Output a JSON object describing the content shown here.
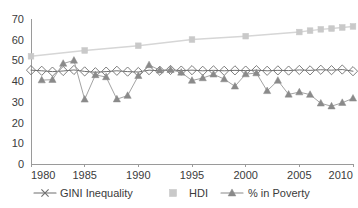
{
  "chart_data": {
    "type": "line",
    "title": "",
    "subtitle": "",
    "xlabel": "",
    "ylabel": "",
    "xlim": [
      1980,
      2010
    ],
    "ylim": [
      0,
      70
    ],
    "ytick_step": 10,
    "xtick_step": 5,
    "yticks": [
      "0",
      "10",
      "20",
      "30",
      "40",
      "50",
      "60",
      "70"
    ],
    "xticks": [
      "1980",
      "1985",
      "1990",
      "1995",
      "2000",
      "2005",
      "2010"
    ],
    "grid": false,
    "legend_position": "bottom",
    "series": [
      {
        "name": "GINI Inequality",
        "marker": "x-diamond",
        "color": "#6e6e6e",
        "line_color": "#6e6e6e",
        "x": [
          1980,
          1981,
          1982,
          1983,
          1984,
          1985,
          1986,
          1987,
          1988,
          1989,
          1990,
          1991,
          1992,
          1993,
          1994,
          1995,
          1996,
          1997,
          1998,
          1999,
          2000,
          2001,
          2002,
          2003,
          2004,
          2005,
          2006,
          2007,
          2008,
          2009,
          2010
        ],
        "values": [
          45.3,
          45.0,
          44.6,
          44.9,
          45.4,
          44.7,
          44.3,
          44.6,
          45.0,
          44.6,
          44.4,
          45.3,
          45.0,
          45.4,
          45.1,
          45.3,
          45.0,
          45.2,
          45.0,
          45.2,
          45.1,
          45.3,
          45.0,
          45.2,
          45.1,
          45.4,
          45.2,
          45.5,
          45.3,
          45.6,
          44.8
        ]
      },
      {
        "name": "HDI",
        "marker": "square",
        "color": "#c9c9c9",
        "line_color": "#d6d6d6",
        "x": [
          1980,
          1985,
          1990,
          1995,
          2000,
          2005,
          2006,
          2007,
          2008,
          2009,
          2010
        ],
        "values": [
          52.0,
          54.8,
          57.1,
          60.1,
          61.7,
          63.7,
          64.4,
          65.0,
          65.4,
          65.9,
          66.4
        ]
      },
      {
        "name": "% in Poverty",
        "marker": "triangle",
        "color": "#8a8a8a",
        "line_color": "#a3a3a3",
        "x": [
          1981,
          1982,
          1983,
          1984,
          1985,
          1986,
          1987,
          1988,
          1989,
          1990,
          1991,
          1992,
          1993,
          1994,
          1995,
          1996,
          1997,
          1998,
          1999,
          2000,
          2001,
          2002,
          2003,
          2004,
          2005,
          2006,
          2007,
          2008,
          2009,
          2010
        ],
        "values": [
          40.5,
          40.7,
          48.5,
          50.0,
          31.2,
          43.0,
          42.0,
          31.3,
          33.0,
          42.6,
          47.8,
          45.3,
          45.5,
          44.2,
          40.3,
          41.5,
          43.3,
          41.0,
          37.5,
          43.4,
          43.9,
          35.3,
          40.3,
          33.6,
          34.7,
          33.5,
          29.3,
          27.9,
          29.6,
          31.7
        ]
      }
    ]
  },
  "legend": {
    "items": [
      {
        "label": "GINI Inequality",
        "marker": "x-diamond",
        "color": "#6e6e6e"
      },
      {
        "label": "HDI",
        "marker": "square",
        "color": "#c9c9c9"
      },
      {
        "label": "% in Poverty",
        "marker": "triangle",
        "color": "#8a8a8a"
      }
    ]
  }
}
